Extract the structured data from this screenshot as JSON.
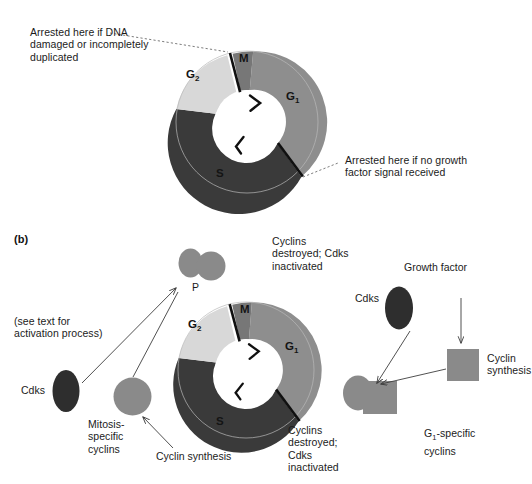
{
  "figure": {
    "panel_b_letter": "(b)",
    "background_color": "#ffffff"
  },
  "palette": {
    "g1_segment": "#8e8e8e",
    "m_segment": "#777777",
    "g2_segment": "#d8d8d8",
    "s_segment": "#3a3a3a",
    "hub_white": "#ffffff",
    "checkpoint_line": "#101010",
    "cdk_dark": "#2e2e2e",
    "cyclin_gray": "#8a8a8a",
    "text": "#1b1b1b",
    "leader_line": "#4a4a4a"
  },
  "top_panel": {
    "wheel": {
      "segments": [
        {
          "name": "M",
          "label": "M",
          "color": "#777777"
        },
        {
          "name": "G1",
          "label": "G",
          "sub": "1",
          "color": "#8e8e8e"
        },
        {
          "name": "S",
          "label": "S",
          "color": "#3a3a3a"
        },
        {
          "name": "G2",
          "label": "G",
          "sub": "2",
          "color": "#d8d8d8"
        }
      ],
      "arrowheads": 2,
      "checkpoints": 2
    },
    "annotations": [
      {
        "name": "g2-m-checkpoint-note",
        "text": "Arrested here if DNA\ndamaged or incompletely\nduplicated"
      },
      {
        "name": "g1-s-checkpoint-note",
        "text": "Arrested here if no growth\nfactor signal received"
      }
    ]
  },
  "bottom_panel": {
    "wheel": {
      "segments": [
        {
          "name": "M",
          "label": "M",
          "color": "#777777"
        },
        {
          "name": "G1",
          "label": "G",
          "sub": "1",
          "color": "#8e8e8e"
        },
        {
          "name": "S",
          "label": "S",
          "color": "#3a3a3a"
        },
        {
          "name": "G2",
          "label": "G",
          "sub": "2",
          "color": "#d8d8d8"
        }
      ]
    },
    "labels": {
      "phosphorylation_tag": "P",
      "activation_note": "(see text for\nactivation process)",
      "cdks_left": "Cdks",
      "mitosis_cyclins": "Mitosis-\nspecific\ncyclins",
      "cyclin_synthesis_left": "Cyclin synthesis",
      "cyclins_destroyed_top": "Cyclins\ndestroyed; Cdks\ninactivated",
      "cyclins_destroyed_bottom": "Cyclins\ndestroyed;\nCdks\ninactivated",
      "growth_factor": "Growth factor",
      "cdks_right": "Cdks",
      "cyclin_synthesis_right": "Cyclin\nsynthesis",
      "g1_specific_cyclins_pre": "G",
      "g1_specific_cyclins_sub": "1",
      "g1_specific_cyclins_post": "-specific\ncyclins"
    }
  }
}
